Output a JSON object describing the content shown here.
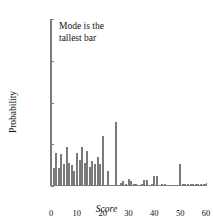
{
  "chart_data": {
    "type": "bar",
    "title": "",
    "subtitle": "",
    "xlabel": "Score",
    "ylabel": "Probability",
    "xlim": [
      0,
      60
    ],
    "ylim": [
      0,
      0.2
    ],
    "grid": false,
    "legend": null,
    "xticks": [
      0,
      10,
      20,
      30,
      40,
      50,
      60
    ],
    "xticklabels": [
      "0",
      "10",
      "20",
      "30",
      "40",
      "50",
      "60"
    ],
    "yticks": [
      0,
      0.05,
      0.1,
      0.15,
      0.2
    ],
    "yticklabels": [
      "0",
      "0.05",
      "0.1",
      "0.15",
      "0.2"
    ],
    "bar_color": "#b2b2b2",
    "bar_edge_color": "#7a7a7a",
    "axis_color": "#7d7d7d",
    "annotations": [
      {
        "text": "Mode is the\ntallest bar",
        "x": 3,
        "y": 0.19
      }
    ],
    "categories": [
      0,
      1,
      2,
      3,
      4,
      5,
      6,
      7,
      8,
      9,
      10,
      11,
      12,
      13,
      14,
      15,
      16,
      17,
      18,
      19,
      20,
      21,
      22,
      23,
      24,
      25,
      26,
      27,
      28,
      29,
      30,
      31,
      32,
      33,
      34,
      35,
      36,
      37,
      38,
      39,
      40,
      41,
      42,
      43,
      44,
      45,
      46,
      47,
      48,
      49,
      50,
      51,
      52,
      53,
      54,
      55,
      56,
      57,
      58,
      59,
      60
    ],
    "values": [
      0.2,
      0.022,
      0.04,
      0.021,
      0.038,
      0.026,
      0.047,
      0.028,
      0.025,
      0.018,
      0.04,
      0.031,
      0.047,
      0.027,
      0.042,
      0.023,
      0.03,
      0.026,
      0.035,
      0.026,
      0.06,
      0.0,
      0.018,
      0.0,
      0.0,
      0.077,
      0.0,
      0.004,
      0.006,
      0.002,
      0.008,
      0.006,
      0.002,
      0.002,
      0.0,
      0.002,
      0.007,
      0.007,
      0.0,
      0.002,
      0.012,
      0.012,
      0.0,
      0.001,
      0.001,
      0.0,
      0.0,
      0.0,
      0.0,
      0.0,
      0.026,
      0.001,
      0.001,
      0.001,
      0.001,
      0.001,
      0.001,
      0.001,
      0.001,
      0.001,
      0.001
    ]
  }
}
